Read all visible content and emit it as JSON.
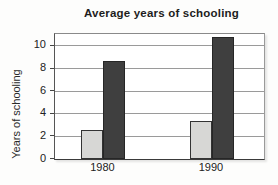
{
  "chart": {
    "title": "Average years of schooling",
    "ylabel": "Years of schooling"
  },
  "chart_data": {
    "type": "bar",
    "title": "Average years of schooling",
    "xlabel": "",
    "ylabel": "Years of schooling",
    "categories": [
      "1980",
      "1990"
    ],
    "series": [
      {
        "name": "light-gray-bars",
        "color": "#d7d7d5",
        "values": [
          2.6,
          3.4
        ]
      },
      {
        "name": "dark-gray-bars",
        "color": "#3f3f3f",
        "values": [
          8.7,
          10.8
        ]
      }
    ],
    "ylim": [
      0,
      11
    ],
    "yticks": [
      0,
      2,
      4,
      6,
      8,
      10
    ],
    "grid": true,
    "legend": "none",
    "colors": {
      "gridline": "#9a9a9a",
      "axis": "#3a3a3a",
      "text": "#222222",
      "plot_background": "#ffffff"
    }
  }
}
